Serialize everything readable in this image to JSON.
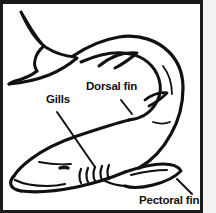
{
  "diagram": {
    "style": "black-and-white line art",
    "frame_color": "#1a1a1a",
    "background_color": "#ffffff",
    "line_color": "#111111",
    "margin_strip_color": "#f4f3f1",
    "labels": [
      {
        "id": "dorsal-fin",
        "text": "Dorsal fin",
        "x": 86,
        "y": 81,
        "leader_line": {
          "x1": 118,
          "y1": 96,
          "x2": 129,
          "y2": 110
        }
      },
      {
        "id": "gills",
        "text": "Gills",
        "x": 46,
        "y": 94,
        "leader_line": {
          "x1": 54,
          "y1": 108,
          "x2": 92,
          "y2": 163
        }
      },
      {
        "id": "pectoral-fin",
        "text": "Pectoral fin",
        "x": 139,
        "y": 195,
        "leader_line": {
          "x1": 174,
          "y1": 175,
          "x2": 189,
          "y2": 190
        }
      }
    ],
    "parts": [
      "caudal fin",
      "dorsal fin",
      "pectoral fin",
      "gill slits",
      "eye",
      "mouth",
      "body"
    ],
    "gill_slit_count": 5
  }
}
